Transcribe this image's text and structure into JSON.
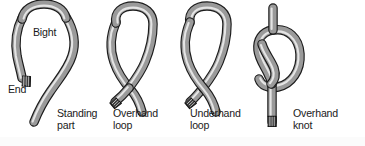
{
  "figure": {
    "background_color": "#ffffff",
    "width": 365,
    "height": 146
  },
  "rope_style": {
    "outline_color": "#1c1c1c",
    "body_color": "#9e9e9e",
    "highlight_color": "#e2e2e2",
    "shadow_color": "#6b6b6b",
    "whipping_color": "#2b2b2b"
  },
  "labels": {
    "bight": "Bight",
    "end": "End",
    "standing_part": "Standing\npart",
    "overhand_loop": "Overhand\nloop",
    "underhand_loop": "Underhand\nloop",
    "overhand_knot": "Overhand\nknot"
  },
  "figures": [
    {
      "name": "bight",
      "caption_primary": "Bight",
      "caption_secondary": "End",
      "caption_tertiary": "Standing\npart",
      "description": "Open U-shaped bight with a whipped rope end at lower left and the standing part running down to the lower right"
    },
    {
      "name": "overhand-loop",
      "caption_primary": "Overhand\nloop",
      "description": "Closed loop where the working end crosses over the standing part"
    },
    {
      "name": "underhand-loop",
      "caption_primary": "Underhand\nloop",
      "description": "Closed loop where the working end crosses under the standing part"
    },
    {
      "name": "overhand-knot",
      "caption_primary": "Overhand\nknot",
      "description": "Completed overhand knot with the end tucked through the loop"
    }
  ]
}
